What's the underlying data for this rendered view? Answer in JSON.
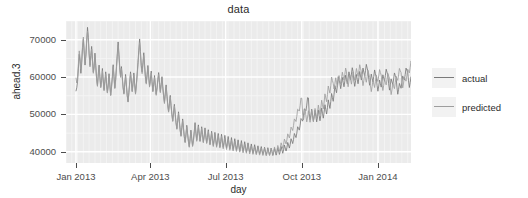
{
  "chart_data": {
    "type": "line",
    "title": "data",
    "xlabel": "day",
    "ylabel": "ahead.3",
    "grid": true,
    "legend_position": "right",
    "ylim": [
      37000,
      75000
    ],
    "yticks": [
      40000,
      50000,
      60000,
      70000
    ],
    "ytick_labels": [
      "40000",
      "50000",
      "60000",
      "70000"
    ],
    "xlim": [
      "2012-12-20",
      "2014-02-10"
    ],
    "xticks": [
      "2013-01-01",
      "2013-04-01",
      "2013-07-01",
      "2013-10-01",
      "2014-01-01"
    ],
    "xtick_labels": [
      "Jan 2013",
      "Apr 2013",
      "Jul 2013",
      "Oct 2013",
      "Jan 2014"
    ],
    "series": [
      {
        "name": "actual",
        "color": "#7a7a7a",
        "values": [
          56200,
          57100,
          58900,
          62400,
          66100,
          64200,
          61000,
          63800,
          67900,
          70100,
          66400,
          63200,
          65500,
          69400,
          73300,
          70600,
          66200,
          63100,
          65800,
          68200,
          64700,
          61300,
          62900,
          66400,
          63100,
          59600,
          57700,
          60800,
          63200,
          60100,
          57400,
          59100,
          62300,
          59200,
          56600,
          58900,
          61400,
          58300,
          55900,
          57800,
          60900,
          58000,
          55200,
          57400,
          60100,
          63300,
          60200,
          57100,
          59400,
          62800,
          66200,
          69400,
          66100,
          62500,
          60200,
          62800,
          60100,
          57300,
          55600,
          58100,
          60700,
          57900,
          55100,
          53400,
          55900,
          58700,
          61400,
          59000,
          56300,
          58400,
          61100,
          58200,
          55600,
          57900,
          60800,
          63900,
          67200,
          70200,
          66800,
          63100,
          61400,
          63800,
          66500,
          63200,
          60100,
          58400,
          60700,
          63100,
          60200,
          57600,
          59200,
          61600,
          58800,
          56300,
          58100,
          60400,
          57800,
          55400,
          57100,
          59400,
          61200,
          58600,
          56100,
          58000,
          60100,
          57400,
          55000,
          53200,
          55700,
          57900,
          55200,
          52600,
          50800,
          52900,
          55100,
          52400,
          50100,
          48300,
          50400,
          52700,
          50100,
          47800,
          46200,
          48400,
          50700,
          48200,
          45900,
          44300,
          46500,
          48800,
          46400,
          44100,
          42600,
          44700,
          47100,
          44900,
          42800,
          41400,
          43500,
          45800,
          43600,
          41600,
          43100,
          45400,
          47800,
          45300,
          43100,
          44900,
          47200,
          45000,
          42900,
          44500,
          46700,
          44600,
          42600,
          44200,
          46400,
          44300,
          42400,
          43800,
          45900,
          43900,
          42000,
          43400,
          45500,
          43500,
          41700,
          43100,
          45200,
          43300,
          41500,
          42900,
          44900,
          43100,
          41300,
          42700,
          44700,
          42900,
          41200,
          42500,
          44400,
          42600,
          41000,
          42300,
          44100,
          42400,
          40800,
          42000,
          43800,
          42100,
          40600,
          41800,
          43500,
          41900,
          40400,
          41600,
          43200,
          41700,
          40200,
          41400,
          43000,
          41500,
          40100,
          41200,
          42700,
          41300,
          39900,
          41000,
          42400,
          41100,
          39800,
          40800,
          42100,
          40900,
          39600,
          40600,
          41900,
          40700,
          39500,
          40400,
          41600,
          40500,
          39400,
          40200,
          41400,
          40300,
          39300,
          40100,
          41200,
          40200,
          39200,
          40000,
          41100,
          40100,
          39100,
          39900,
          41000,
          40000,
          39000,
          39800,
          40900,
          40000,
          39100,
          39900,
          41100,
          40200,
          39300,
          40100,
          41400,
          40500,
          39600,
          40500,
          41800,
          41000,
          40200,
          41100,
          42500,
          41800,
          41000,
          42000,
          43500,
          42900,
          42200,
          43300,
          44900,
          44400,
          43800,
          45000,
          46700,
          46300,
          45800,
          47100,
          48900,
          48600,
          48200,
          49600,
          51500,
          51300,
          51000,
          52500,
          54500,
          54400,
          50200,
          48600,
          49800,
          51400,
          49700,
          48100,
          49400,
          51100,
          49500,
          48000,
          49400,
          51200,
          49700,
          48300,
          49800,
          51700,
          50300,
          49000,
          50600,
          52600,
          51300,
          50100,
          51800,
          53900,
          52700,
          51600,
          53400,
          55600,
          54500,
          53500,
          55400,
          57700,
          56700,
          55800,
          57800,
          60100,
          59200,
          58400,
          56900,
          58300,
          59900,
          58600,
          57400,
          58900,
          60500,
          59300,
          58200,
          59700,
          61400,
          60300,
          59300,
          60800,
          62500,
          61500,
          58900,
          57500,
          59000,
          60700,
          59400,
          58200,
          59800,
          61500,
          60300,
          59200,
          60700,
          62400,
          61300,
          60300,
          61700,
          63400,
          62400,
          61500,
          59400,
          57800,
          59200,
          60800,
          59700,
          58700,
          60200,
          61900,
          60900,
          60000,
          57800,
          56200,
          57600,
          59200,
          58200,
          57300,
          58900,
          60600,
          59700,
          58900,
          60400,
          62100,
          61300,
          60600,
          58200,
          56500,
          57900,
          59500,
          58700,
          58000,
          59500,
          61100,
          60400,
          59800,
          57300,
          55400,
          56700,
          58300,
          57600,
          57000,
          58600,
          60300,
          59700,
          59200,
          60700,
          62400,
          61800,
          61300,
          59000,
          57200,
          58500,
          60100,
          59500,
          59000,
          60500,
          62200,
          61700,
          61200,
          62700,
          64400,
          63900,
          61000,
          59000,
          58300,
          59800,
          57900,
          56100,
          57400,
          59000,
          58400,
          57900,
          59400,
          61100,
          60600,
          60200,
          59700
        ]
      },
      {
        "name": "predicted",
        "color": "#9e9e9e",
        "values": [
          59800,
          58400,
          60200,
          63600,
          67000,
          65200,
          62100,
          64600,
          68400,
          70700,
          67100,
          64000,
          66100,
          69900,
          72300,
          69900,
          65700,
          62700,
          65100,
          67500,
          64200,
          61000,
          62400,
          65700,
          62600,
          59300,
          57500,
          60300,
          62600,
          59700,
          57100,
          58700,
          61700,
          58800,
          56300,
          58500,
          60900,
          58000,
          55700,
          57500,
          60400,
          57700,
          55000,
          57100,
          59700,
          62800,
          59800,
          56900,
          59000,
          62300,
          65500,
          68500,
          65400,
          62000,
          59900,
          62300,
          59700,
          57100,
          55400,
          57800,
          60200,
          57600,
          54900,
          53300,
          55600,
          58300,
          60900,
          58600,
          56000,
          58000,
          60600,
          57900,
          55400,
          57500,
          60300,
          63300,
          66400,
          69200,
          66000,
          62600,
          60900,
          63200,
          65800,
          62700,
          59700,
          58100,
          60300,
          62600,
          59800,
          57300,
          58800,
          61100,
          58400,
          56000,
          57700,
          59900,
          57400,
          55100,
          56700,
          58900,
          60700,
          58200,
          55800,
          57600,
          59600,
          57000,
          54700,
          52900,
          55300,
          57400,
          54800,
          52300,
          50600,
          52600,
          54700,
          52100,
          49900,
          48100,
          50100,
          52300,
          49800,
          47600,
          46000,
          48100,
          50300,
          47900,
          45700,
          44100,
          46200,
          48400,
          46100,
          43900,
          42400,
          44400,
          46700,
          44600,
          42600,
          41200,
          43200,
          45400,
          43300,
          41400,
          42800,
          45000,
          47300,
          44900,
          42800,
          44600,
          46800,
          44700,
          42700,
          44200,
          46300,
          44300,
          42400,
          43900,
          46000,
          44000,
          42200,
          43500,
          45500,
          43600,
          41800,
          43100,
          45100,
          43200,
          41400,
          42700,
          44700,
          43000,
          41200,
          42500,
          44400,
          42700,
          41000,
          42300,
          44100,
          42400,
          40800,
          42000,
          43700,
          42100,
          40600,
          41800,
          43400,
          41900,
          40400,
          41500,
          43100,
          41700,
          40200,
          41300,
          42900,
          41500,
          40100,
          41100,
          42600,
          41300,
          39900,
          40900,
          42300,
          41000,
          39700,
          40700,
          42000,
          40800,
          39600,
          40500,
          41800,
          40600,
          39400,
          40300,
          41500,
          40400,
          39300,
          40100,
          41300,
          40200,
          39200,
          40000,
          41100,
          40100,
          39100,
          39900,
          41000,
          40000,
          39000,
          39800,
          40900,
          39900,
          38900,
          39700,
          40800,
          39900,
          39000,
          39800,
          41000,
          40100,
          39200,
          40000,
          41300,
          40400,
          39500,
          40400,
          41700,
          40900,
          40100,
          41000,
          42400,
          41700,
          40900,
          41900,
          43400,
          42800,
          42100,
          43200,
          44800,
          44300,
          43700,
          44900,
          46600,
          46200,
          45700,
          47000,
          48800,
          48500,
          48100,
          49500,
          51400,
          51200,
          50900,
          52400,
          54400,
          54300,
          50100,
          48500,
          49700,
          51300,
          49600,
          48000,
          49300,
          51000,
          49400,
          47900,
          49300,
          51100,
          49600,
          48200,
          49700,
          51600,
          50200,
          48900,
          50500,
          52500,
          51200,
          50000,
          51700,
          53800,
          52600,
          51500,
          53300,
          55500,
          54400,
          53400,
          55300,
          57600,
          56600,
          55700,
          57700,
          60000,
          59100,
          58300,
          56800,
          58200,
          59800,
          58500,
          57300,
          58800,
          60400,
          59200,
          58100,
          59600,
          61300,
          60200,
          59200,
          60700,
          62400,
          61400,
          58800,
          57400,
          58900,
          60600,
          59300,
          58100,
          59700,
          61400,
          60200,
          59100,
          60600,
          62300,
          61200,
          60200,
          61600,
          63300,
          62300,
          61400,
          59300,
          57700,
          59100,
          60700,
          59600,
          58600,
          60100,
          61800,
          60800,
          59900,
          57700,
          56100,
          57500,
          59100,
          58100,
          57200,
          58800,
          60500,
          59600,
          58800,
          60300,
          62000,
          61200,
          60500,
          58100,
          56400,
          57800,
          59400,
          58600,
          57900,
          59400,
          61000,
          60300,
          59700,
          57200,
          55300,
          56600,
          58200,
          57500,
          56900,
          58500,
          60200,
          59600,
          59100,
          60600,
          62300,
          61700,
          61200,
          58900,
          57100,
          58400,
          60000,
          59400,
          58900,
          60400,
          62100,
          61600,
          61100,
          62600,
          64300,
          63800,
          60900,
          58900,
          58200,
          59700,
          57800,
          56000,
          57300,
          58900,
          58300,
          57800,
          59300,
          61000,
          60500,
          60100,
          59600
        ]
      }
    ]
  },
  "legend": {
    "items": [
      {
        "label": "actual"
      },
      {
        "label": "predicted"
      }
    ]
  },
  "colors": {
    "panel_background": "#ebebeb",
    "major_gridline": "#ffffff",
    "minor_gridline": "#f5f5f5",
    "text": "#4d4d4d",
    "title_text": "#2b2b2b",
    "legend_key_background": "#f2f2f2"
  }
}
